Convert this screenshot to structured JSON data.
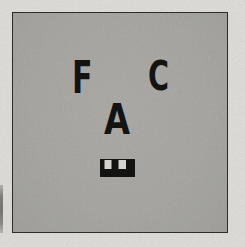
{
  "figure": {
    "letters": {
      "f": "F",
      "c": "C",
      "a": "A",
      "e_rotated": "E"
    },
    "colors": {
      "margin_background": "#f3f1ec",
      "card_gray": "#b9b8b4",
      "card_border": "#32322e",
      "glyph_black": "#161614",
      "notch_white": "#ecebe7"
    }
  }
}
